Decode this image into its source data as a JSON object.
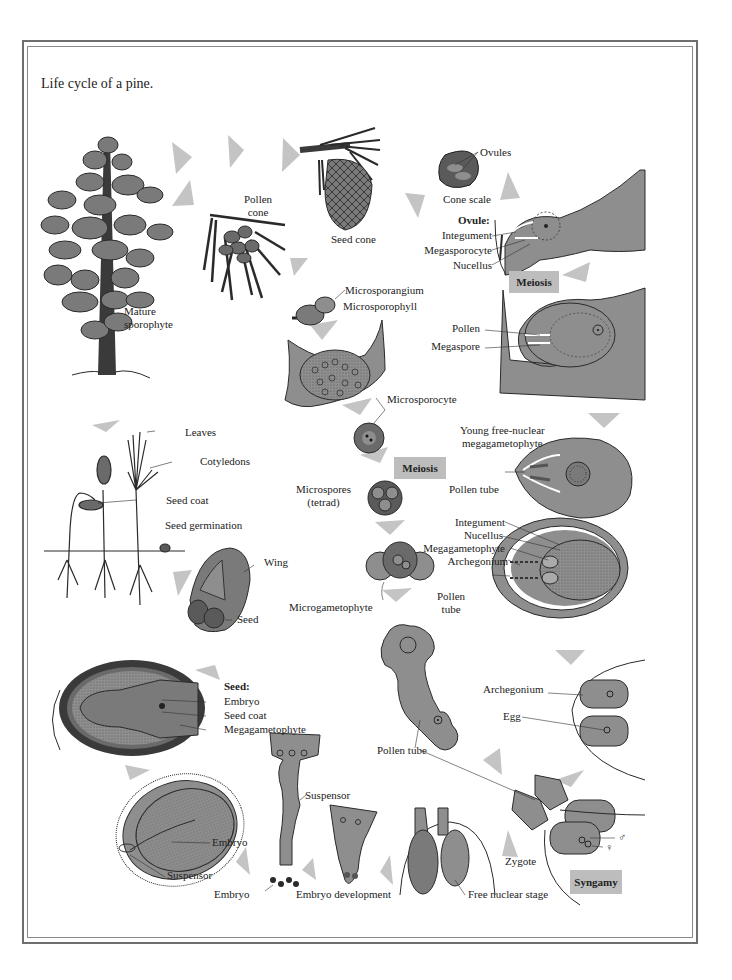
{
  "figure": {
    "title": "Life cycle of a pine.",
    "colors": {
      "tissue_fill": "#8e8e8e",
      "tissue_dark": "#5a5a5a",
      "outline": "#2a2a2a",
      "arrow": "#c4c4c4",
      "badge_bg": "#bdbdbd",
      "frame": "#6f6f6f"
    }
  },
  "stages": {
    "mature_sporophyte": "Mature\nsporophyte",
    "pollen_cone": "Pollen\ncone",
    "seed_cone": "Seed cone",
    "ovules": "Ovules",
    "cone_scale": "Cone scale",
    "ovule_heading": "Ovule:",
    "integument": "Integument",
    "megasporocyte": "Megasporocyte",
    "nucellus": "Nucellus",
    "meiosis_female": "Meiosis",
    "microsporangium": "Microsporangium",
    "microsporophyll": "Microsporophyll",
    "pollen": "Pollen",
    "megaspore": "Megaspore",
    "microsporocyte": "Microsporocyte",
    "young_megagametophyte": "Young free-nuclear\nmegagametophyte",
    "meiosis_male": "Meiosis",
    "microspores": "Microspores\n(tetrad)",
    "pollen_tube_1": "Pollen tube",
    "integument_2": "Integument",
    "nucellus_2": "Nucellus",
    "megagametophyte_2": "Megagametophyte",
    "archegonium_2": "Archegonium",
    "pollen_tube_2": "Pollen\ntube",
    "leaves": "Leaves",
    "cotyledons": "Cotyledons",
    "seed_coat_germ": "Seed coat",
    "seed_germination": "Seed germination",
    "wing": "Wing",
    "seed": "Seed",
    "microgametophyte": "Microgametophyte",
    "seed_heading": "Seed:",
    "embryo_seed": "Embryo",
    "seed_coat": "Seed coat",
    "megagametophyte_seed": "Megagametophyte",
    "archegonium_3": "Archegonium",
    "egg": "Egg",
    "pollen_tube_3": "Pollen tube",
    "suspensor_1": "Suspensor",
    "embryo_2": "Embryo",
    "suspensor_2": "Suspensor",
    "embryo_3": "Embryo",
    "embryo_development": "Embryo development",
    "free_nuclear_stage": "Free nuclear stage",
    "zygote": "Zygote",
    "male_symbol": "♂",
    "female_symbol": "♀",
    "syngamy": "Syngamy"
  }
}
